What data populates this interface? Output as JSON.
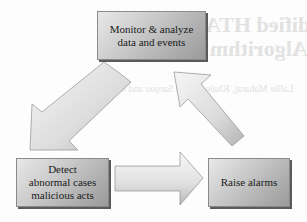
{
  "diagram": {
    "type": "cycle-flow",
    "nodes": [
      {
        "id": "monitor",
        "lines": [
          "Monitor & analyze",
          "data and events"
        ]
      },
      {
        "id": "detect",
        "lines": [
          "Detect",
          "abnormal cases",
          "malicious acts"
        ]
      },
      {
        "id": "alarm",
        "lines": [
          "Raise alarms"
        ]
      }
    ],
    "edges": [
      {
        "from": "monitor",
        "to": "detect",
        "direction": "down-left"
      },
      {
        "from": "detect",
        "to": "alarm",
        "direction": "right"
      },
      {
        "from": "alarm",
        "to": "monitor",
        "direction": "up-left"
      }
    ],
    "colors": {
      "box_light": "#e8e8e8",
      "box_dark": "#9a9a9a",
      "box_shadow": "#5a5a5a",
      "arrow_light": "#f4f4f4",
      "arrow_dark": "#b8b8b8",
      "arrow_edge": "#9a9a9a"
    }
  },
  "background_bleed": {
    "title_line1": "Implementation of Modified HTA",
    "title_line2": "Algorithm",
    "body_line1": "Lallie Maharaj, Khaled Salah Sanjou and Ghana"
  }
}
